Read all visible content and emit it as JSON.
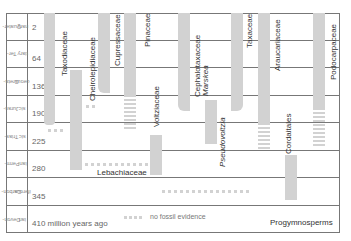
{
  "diagram": {
    "periods": [
      {
        "name": "Quater-nary",
        "line1": "Quater-",
        "line2": "nary",
        "age": "2"
      },
      {
        "name": "Ter-tiary",
        "line1": "Ter-",
        "line2": "tiary",
        "age": "64"
      },
      {
        "name": "Creta-ceous",
        "line1": "Creta-",
        "line2": "ceous",
        "age": "136"
      },
      {
        "name": "Juras-sic",
        "line1": "Juras-",
        "line2": "sic",
        "age": "190"
      },
      {
        "name": "Trias-sic",
        "line1": "Trias-",
        "line2": "sic",
        "age": "225"
      },
      {
        "name": "Perm-ian",
        "line1": "Perm-",
        "line2": "ian",
        "age": "280"
      },
      {
        "name": "Carbon-iferous",
        "line1": "Carbon-",
        "line2": "iferous",
        "age": "345"
      },
      {
        "name": "Devon-ian",
        "line1": "Devon-",
        "line2": "ian",
        "age": "410 million years ago"
      }
    ],
    "taxa": {
      "taxodiaceae": "Taxodiaceae",
      "cheirolepidiaceae": "Cheirolepidiaceae",
      "cupressaceae": "Cupressaceae",
      "pinaceae": "Pinaceae",
      "voltziaceae": "Voltziaceae",
      "cephalotaxaceae": "Cephalotaxaceae",
      "marskea": "Marskea",
      "pseudovoltzia": "Pseudovoltzia",
      "taxaceae": "Taxaceae",
      "araucariaceae": "Araucariaceae",
      "podocarpaceae": "Podocarpaceae",
      "cordaitales": "Cordaitales",
      "lebachiaceae": "Lebachiaceae",
      "progymnosperms": "Progymnosperms"
    },
    "legend": {
      "no_fossil": "no fossil evidence"
    },
    "colors": {
      "bar": "#d2d2d2",
      "grid": "#777777"
    }
  }
}
